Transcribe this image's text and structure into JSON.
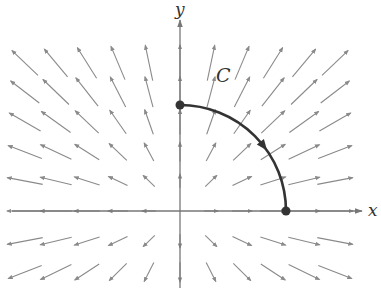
{
  "figure": {
    "type": "vector-field-with-curve",
    "axes": {
      "x_label": "x",
      "y_label": "y",
      "origin_px": [
        180,
        211
      ],
      "x_range_px": [
        12,
        362
      ],
      "y_range_px": [
        288,
        20
      ],
      "color": "#777777"
    },
    "field": {
      "description": "radial vector field pointing away from origin",
      "color": "#8a8a8a",
      "grid_x_px": [
        25,
        56,
        87,
        118,
        149,
        180,
        211,
        242,
        273,
        304,
        335
      ],
      "grid_y_px": [
        63,
        92,
        122,
        152,
        181,
        211,
        241,
        272
      ],
      "scale": 0.19,
      "max_length": 36
    },
    "curve": {
      "label": "C",
      "shape": "quarter-circle",
      "center_px": [
        180,
        211
      ],
      "radius_px": 106,
      "start_px": [
        180,
        105
      ],
      "end_px": [
        286,
        211
      ],
      "direction": "clockwise",
      "arrow_at_fraction": 0.58,
      "color": "#333333",
      "label_pos_px": [
        216,
        82
      ]
    }
  }
}
